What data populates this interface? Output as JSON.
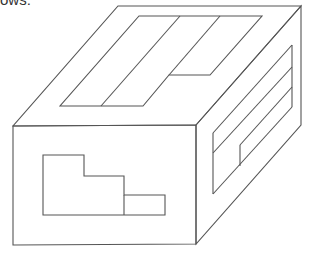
{
  "caption": {
    "fragment": "ows:"
  },
  "diagram": {
    "stroke_color": "#555555",
    "background": "#ffffff",
    "faces": [
      {
        "name": "top",
        "pattern": "stepped rectangle split by two diagonals"
      },
      {
        "name": "front",
        "pattern": "stepped L-shape with small divided block"
      },
      {
        "name": "right",
        "pattern": "diagonal bands with vertical divider"
      }
    ]
  }
}
